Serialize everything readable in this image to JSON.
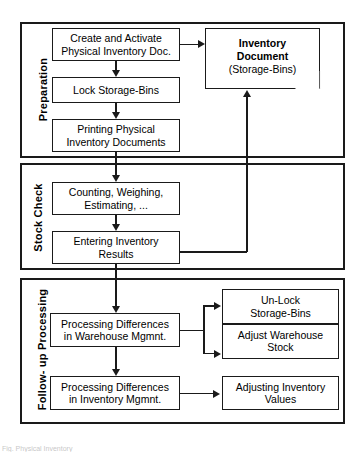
{
  "diagram": {
    "type": "flowchart",
    "phases": [
      {
        "id": "preparation",
        "label": "Preparation"
      },
      {
        "id": "stock-check",
        "label": "Stock Check"
      },
      {
        "id": "follow-up",
        "label": "Follow- up Processing"
      }
    ],
    "nodes": {
      "create_activate": {
        "line1": "Create and Activate",
        "line2": "Physical Inventory Doc."
      },
      "lock_bins": {
        "line1": "Lock Storage-Bins",
        "line2": ""
      },
      "printing": {
        "line1": "Printing Physical",
        "line2": "Inventory Documents"
      },
      "counting": {
        "line1": "Counting, Weighing,",
        "line2": "Estimating, ..."
      },
      "entering": {
        "line1": "Entering Inventory",
        "line2": "Results"
      },
      "proc_warehouse": {
        "line1": "Processing Differences",
        "line2": "in Warehouse Mgmnt."
      },
      "proc_inventory": {
        "line1": "Processing Differences",
        "line2": "in Inventory Mgmnt."
      },
      "unlock_bins": {
        "line1": "Un-Lock",
        "line2": "Storage-Bins"
      },
      "adjust_stock": {
        "line1": "Adjust Warehouse",
        "line2": "Stock"
      },
      "adjust_values": {
        "line1": "Adjusting Inventory",
        "line2": "Values"
      }
    },
    "document": {
      "line1": "Inventory",
      "line2": "Document",
      "line3": "(Storage-Bins)"
    },
    "colors": {
      "stroke": "#1a1a1a",
      "fill": "#ffffff",
      "text": "#000000"
    },
    "caption": "Fig.  Physical Inventory"
  }
}
